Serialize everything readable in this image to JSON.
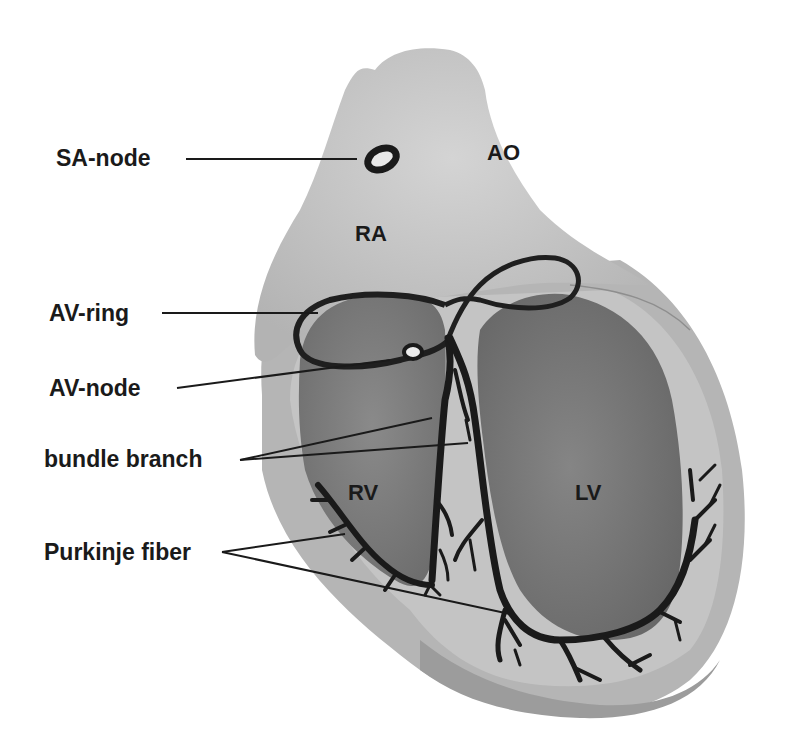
{
  "diagram": {
    "type": "anatomical",
    "labels": [
      {
        "id": "sa_node",
        "text": "SA-node"
      },
      {
        "id": "av_ring",
        "text": "AV-ring"
      },
      {
        "id": "av_node",
        "text": "AV-node"
      },
      {
        "id": "bundle_branch",
        "text": "bundle branch"
      },
      {
        "id": "purkinje_fiber",
        "text": "Purkinje fiber"
      }
    ],
    "regions": [
      {
        "id": "ao",
        "text": "AO"
      },
      {
        "id": "ra",
        "text": "RA"
      },
      {
        "id": "rv",
        "text": "RV"
      },
      {
        "id": "lv",
        "text": "LV"
      }
    ],
    "colors": {
      "background": "#ffffff",
      "outer_tissue": "#bdbdbd",
      "atria": "#c8c8c8",
      "ventricle_chamber": "#7a7a7a",
      "conduction": "#1a1a1a",
      "text": "#1a1a1a"
    }
  }
}
